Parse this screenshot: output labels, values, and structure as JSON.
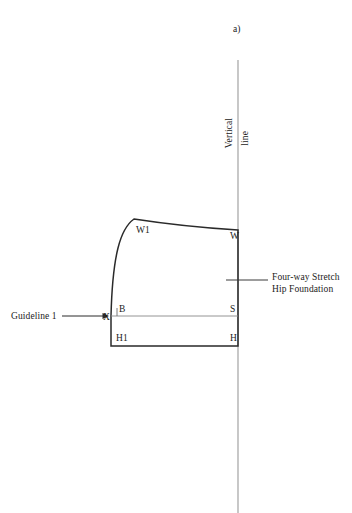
{
  "figure": {
    "panel_label": "a)",
    "background_color": "#ffffff",
    "ink_color": "#1b1b1b",
    "guide_color": "#8f8f8f",
    "outline_color": "#2a2a2a"
  },
  "vertical_line": {
    "label_part1": "Vertical",
    "label_part2": "line",
    "x": 238,
    "y_top": 60,
    "y_bottom": 513,
    "color": "#9a9a9a"
  },
  "callout": {
    "line1": "Four-way Stretch",
    "line2": "Hip Foundation",
    "leader_x_start": 226,
    "leader_x_end": 268,
    "leader_y": 280
  },
  "guideline": {
    "label": "Guideline 1",
    "arrow_x_start": 62,
    "arrow_x_end": 108,
    "arrow_y": 316
  },
  "pattern_points": [
    {
      "name": "W1",
      "label": "W1",
      "x": 134,
      "y": 219
    },
    {
      "name": "W",
      "label": "W",
      "x": 238,
      "y": 230
    },
    {
      "name": "S",
      "label": "S",
      "x": 238,
      "y": 316
    },
    {
      "name": "H",
      "label": "H",
      "x": 238,
      "y": 346
    },
    {
      "name": "H1",
      "label": "H1",
      "x": 111,
      "y": 346
    },
    {
      "name": "X",
      "label": "X",
      "x": 111,
      "y": 316
    },
    {
      "name": "B",
      "label": "B",
      "x": 118,
      "y": 316
    }
  ],
  "measurements": {
    "shape_left_x": 111,
    "shape_right_x": 238,
    "shape_top_y": 219,
    "shape_bottom_y": 346,
    "waist_line_y": 316
  }
}
